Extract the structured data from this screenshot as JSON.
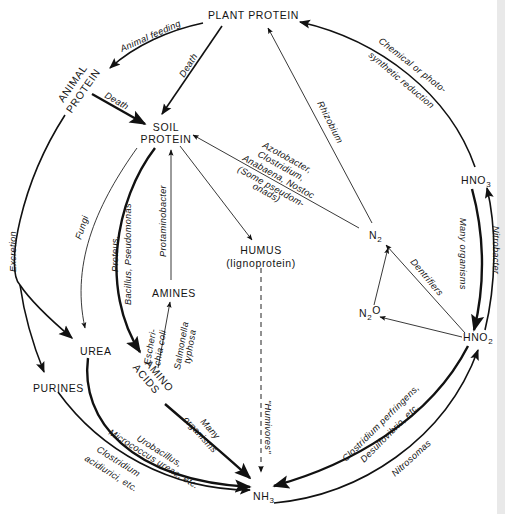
{
  "diagram": {
    "nodes": {
      "plant_protein": "PLANT PROTEIN",
      "animal_protein_1": "ANIMAL",
      "animal_protein_2": "PROTEIN",
      "soil_protein_1": "SOIL",
      "soil_protein_2": "PROTEIN",
      "humus": "HUMUS",
      "humus_sub": "(lignoprotein)",
      "amines": "AMINES",
      "amino_acids_1": "AMINO",
      "amino_acids_2": "ACIDS",
      "urea": "UREA",
      "purines": "PURINES",
      "nh3": "NH",
      "nh3_sub": "3",
      "n2": "N",
      "n2_sub": "2",
      "n2o_a": "N",
      "n2o_sub": "2",
      "n2o_b": "O",
      "hno2": "HNO",
      "hno2_sub": "2",
      "hno3": "HNO",
      "hno3_sub": "3"
    },
    "edges": [
      {
        "from": "PLANT PROTEIN",
        "to": "ANIMAL PROTEIN",
        "label": "Animal feeding"
      },
      {
        "from": "PLANT PROTEIN",
        "to": "SOIL PROTEIN",
        "label": "Death"
      },
      {
        "from": "ANIMAL PROTEIN",
        "to": "SOIL PROTEIN",
        "label": "Death"
      },
      {
        "from": "HNO3",
        "to": "PLANT PROTEIN",
        "label_1": "Chemical or photo-",
        "label_2": "synthetic reduction"
      },
      {
        "from": "N2",
        "to": "PLANT PROTEIN",
        "label": "Rhizobium"
      },
      {
        "from": "N2",
        "to": "SOIL PROTEIN",
        "label_1": "Azotobacter,",
        "label_2": "Clostridium,",
        "label_3": "Anabaena, Nostoc",
        "label_4": "(Some pseudom-",
        "label_5": "onads)"
      },
      {
        "from": "SOIL PROTEIN",
        "to": "HUMUS",
        "label": ""
      },
      {
        "from": "SOIL PROTEIN",
        "to": "UREA",
        "label": "Fungi"
      },
      {
        "from": "SOIL PROTEIN",
        "to": "AMINO ACIDS",
        "label_1": "Proteus,",
        "label_2": "Bacillus, Pseudomonas"
      },
      {
        "from": "AMINES",
        "to": "SOIL PROTEIN",
        "label": "Protaminobacter"
      },
      {
        "from": "AMINO ACIDS",
        "to": "AMINES",
        "label_1": "Escheri-",
        "label_2": "chia coli",
        "label_3": "Salmonella",
        "label_4": "typhosa"
      },
      {
        "from": "ANIMAL PROTEIN",
        "to": "UREA",
        "label": "Excretion"
      },
      {
        "from": "ANIMAL PROTEIN",
        "to": "PURINES",
        "label": ""
      },
      {
        "from": "HUMUS",
        "to": "NH3",
        "label": "\"Humivores\""
      },
      {
        "from": "AMINO ACIDS",
        "to": "NH3",
        "label_1": "Many",
        "label_2": "organisms"
      },
      {
        "from": "UREA",
        "to": "NH3",
        "label_1": "Urobacillus,",
        "label_2": "Micrococcus ureae, etc."
      },
      {
        "from": "PURINES",
        "to": "NH3",
        "label_1": "Clostridium",
        "label_2": "acidiurici, etc."
      },
      {
        "from": "HNO2",
        "to": "NH3",
        "label_1": "Clostridium perfringens,",
        "label_2": "Desulfovibrio, etc."
      },
      {
        "from": "NH3",
        "to": "HNO2",
        "label": "Nitrosomas"
      },
      {
        "from": "HNO3",
        "to": "HNO2",
        "label": "Many organisms"
      },
      {
        "from": "HNO2",
        "to": "HNO3",
        "label": "Nitrobacter"
      },
      {
        "from": "HNO2",
        "to": "N2",
        "label": "Dentrifiers"
      },
      {
        "from": "HNO2",
        "to": "N2O",
        "label": ""
      },
      {
        "from": "N2O",
        "to": "N2",
        "label": ""
      }
    ]
  }
}
